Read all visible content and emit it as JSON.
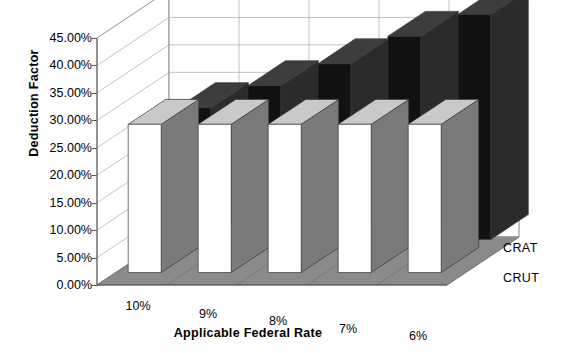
{
  "chart_data": {
    "type": "bar",
    "title": "",
    "subtitle": "",
    "xlabel": "Applicable Federal Rate",
    "ylabel": "Deduction Factor",
    "categories": [
      "10%",
      "9%",
      "8%",
      "7%",
      "6%"
    ],
    "series": [
      {
        "name": "CRAT",
        "values": [
          24.0,
          28.0,
          32.0,
          37.0,
          41.0
        ],
        "color": "#111111"
      },
      {
        "name": "CRUT",
        "values": [
          27.0,
          27.0,
          27.0,
          27.0,
          27.0
        ],
        "color": "#ffffff"
      }
    ],
    "ylim": [
      0,
      45
    ],
    "yticks": [
      "0.00%",
      "5.00%",
      "10.00%",
      "15.00%",
      "20.00%",
      "25.00%",
      "30.00%",
      "35.00%",
      "40.00%",
      "45.00%"
    ],
    "ytick_values": [
      0,
      5,
      10,
      15,
      20,
      25,
      30,
      35,
      40,
      45
    ],
    "grid": true,
    "legend_position": "right",
    "projection": "3d",
    "legend": [
      "CRAT",
      "CRUT"
    ]
  },
  "axis": {
    "y_title": "Deduction Factor",
    "x_title": "Applicable Federal Rate"
  },
  "colors": {
    "crat_front": "#111111",
    "crat_side": "#2b2b2b",
    "crat_top": "#3d3d3d",
    "crut_front": "#ffffff",
    "crut_side": "#7a7a7a",
    "crut_top": "#c9c9c9",
    "floor": "#8a8a8a",
    "wall": "#ffffff",
    "grid": "#a8a8a8",
    "axis": "#555555"
  }
}
